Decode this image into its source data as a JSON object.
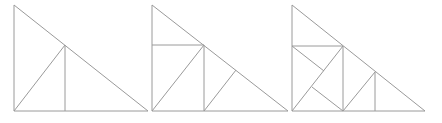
{
  "diagram": {
    "width": 442,
    "height": 123,
    "stroke_color": "#9a9a9a",
    "background": "#ffffff",
    "figures": [
      {
        "name": "stage-1",
        "lines": [
          [
            14,
            5,
            14,
            111
          ],
          [
            14,
            111,
            148,
            111
          ],
          [
            14,
            5,
            148,
            111
          ],
          [
            14,
            111,
            65,
            45
          ],
          [
            65,
            45,
            65,
            111
          ]
        ]
      },
      {
        "name": "stage-2",
        "lines": [
          [
            152,
            5,
            152,
            111
          ],
          [
            152,
            111,
            288,
            111
          ],
          [
            152,
            5,
            288,
            111
          ],
          [
            152,
            45,
            204,
            45
          ],
          [
            152,
            111,
            204,
            45
          ],
          [
            204,
            45,
            204,
            111
          ],
          [
            204,
            111,
            236,
            70
          ]
        ]
      },
      {
        "name": "stage-3",
        "lines": [
          [
            292,
            5,
            292,
            111
          ],
          [
            292,
            111,
            425,
            111
          ],
          [
            292,
            5,
            425,
            111
          ],
          [
            292,
            46,
            343,
            46
          ],
          [
            292,
            111,
            343,
            46
          ],
          [
            343,
            46,
            343,
            111
          ],
          [
            292,
            46,
            324,
            71
          ],
          [
            312,
            87,
            343,
            111
          ],
          [
            343,
            111,
            375,
            72
          ],
          [
            375,
            72,
            375,
            111
          ]
        ]
      }
    ]
  }
}
